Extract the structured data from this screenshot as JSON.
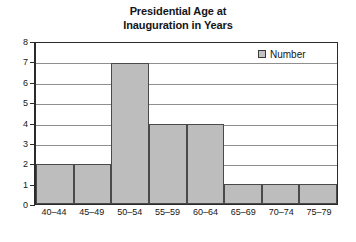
{
  "chart_data": {
    "type": "bar",
    "title": "Presidential Age at Inauguration in Years",
    "title_lines": [
      "Presidential Age at",
      "Inauguration in Years"
    ],
    "xlabel": "",
    "ylabel": "",
    "categories": [
      "40–44",
      "45–49",
      "50–54",
      "55–59",
      "60–64",
      "65–69",
      "70–74",
      "75–79"
    ],
    "values": [
      2,
      2,
      7,
      4,
      4,
      1,
      1,
      1
    ],
    "series": [
      {
        "name": "Number",
        "values": [
          2,
          2,
          7,
          4,
          4,
          1,
          1,
          1
        ]
      }
    ],
    "ylim": [
      0,
      8
    ],
    "yticks": [
      8,
      7,
      6,
      5,
      4,
      3,
      2,
      1,
      0
    ],
    "grid": true,
    "legend": {
      "position": "top-right",
      "entries": [
        {
          "label": "Number",
          "swatch_color": "#c2c2c2"
        }
      ]
    },
    "colors": {
      "bar_fill": "#bdbdbd",
      "bar_border": "#4a4a4a",
      "gridline": "#8f8f8f",
      "axis": "#2b2b2b",
      "text": "#161616",
      "background": "#ffffff"
    }
  }
}
